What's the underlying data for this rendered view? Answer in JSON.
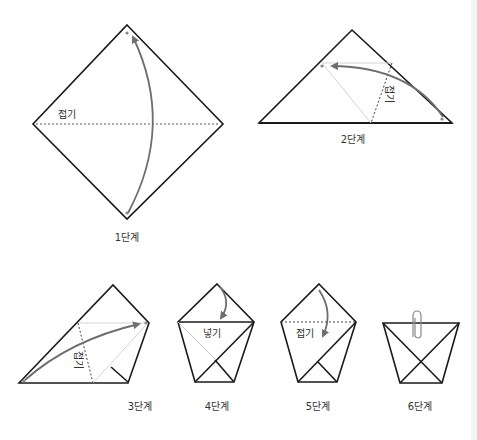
{
  "colors": {
    "line": "#1a1a1a",
    "arrow": "#6e6e6e",
    "guide": "#cfcfcf",
    "dashed": "#444444",
    "dot": "#888888",
    "text": "#333333"
  },
  "steps": [
    {
      "id": 1,
      "label": "1단계",
      "fold_label": "접기"
    },
    {
      "id": 2,
      "label": "2단계",
      "fold_label": "접기"
    },
    {
      "id": 3,
      "label": "3단계",
      "fold_label": "접기"
    },
    {
      "id": 4,
      "label": "4단계",
      "fold_label": "넣기"
    },
    {
      "id": 5,
      "label": "5단계",
      "fold_label": "접기"
    },
    {
      "id": 6,
      "label": "6단계",
      "fold_label": ""
    }
  ],
  "icons": {
    "step6_clip": "paperclip-icon"
  }
}
